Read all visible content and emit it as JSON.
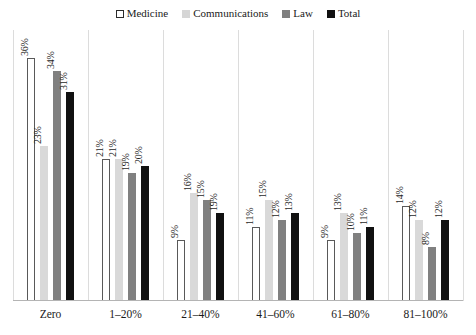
{
  "chart_data": {
    "type": "bar",
    "title": "",
    "subtitle": "",
    "xlabel": "",
    "ylabel": "",
    "ylim": [
      0,
      40
    ],
    "grid": false,
    "legend_position": "top-center",
    "value_suffix": "%",
    "categories": [
      "Zero",
      "1–20%",
      "21–40%",
      "41–60%",
      "61–80%",
      "81–100%"
    ],
    "series": [
      {
        "name": "Medicine",
        "color": "#ffffff",
        "border_color": "#595959",
        "values": [
          36,
          21,
          9,
          11,
          9,
          14
        ],
        "labels": [
          "36%",
          "21%",
          "9%",
          "11%",
          "9%",
          "14%"
        ]
      },
      {
        "name": "Communications",
        "color": "#d9d9d9",
        "border_color": "#d9d9d9",
        "values": [
          23,
          21,
          16,
          15,
          13,
          12
        ],
        "labels": [
          "23%",
          "21%",
          "16%",
          "15%",
          "13%",
          "12%"
        ]
      },
      {
        "name": "Law",
        "color": "#808080",
        "border_color": "#808080",
        "values": [
          34,
          19,
          15,
          12,
          10,
          8
        ],
        "labels": [
          "34%",
          "19%",
          "15%",
          "12%",
          "10%",
          "8%"
        ]
      },
      {
        "name": "Total",
        "color": "#111111",
        "border_color": "#111111",
        "values": [
          31,
          20,
          13,
          13,
          11,
          12
        ],
        "labels": [
          "31%",
          "20%",
          "19%",
          "13%",
          "11%",
          "12%"
        ]
      }
    ]
  },
  "legend": {
    "items": [
      {
        "label": "Medicine",
        "swatch": "swatch-medicine"
      },
      {
        "label": "Communications",
        "swatch": "swatch-communications"
      },
      {
        "label": "Law",
        "swatch": "swatch-law"
      },
      {
        "label": "Total",
        "swatch": "swatch-total"
      }
    ]
  },
  "axis": {
    "categories": [
      "Zero",
      "1–20%",
      "21–40%",
      "41–60%",
      "61–80%",
      "81–100%"
    ]
  },
  "colors": {
    "medicine": "#ffffff",
    "communications": "#d9d9d9",
    "law": "#808080",
    "total": "#111111",
    "separator": "#dcdcdc",
    "axis": "#b4b4b4",
    "text": "#1a1a1a"
  }
}
